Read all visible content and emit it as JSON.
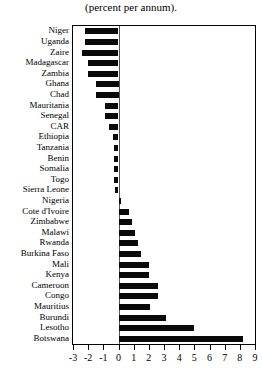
{
  "chart_data": {
    "type": "bar",
    "orientation": "horizontal",
    "title": "(percent per annum).",
    "xlabel": "",
    "ylabel": "",
    "xlim": [
      -3,
      9
    ],
    "xticks": [
      -3,
      -2,
      -1,
      0,
      1,
      2,
      3,
      4,
      5,
      6,
      7,
      8,
      9
    ],
    "xticklabels": [
      "-3",
      "-2",
      "-1",
      "0",
      "1",
      "2",
      "3",
      "4",
      "5",
      "6",
      "7",
      "8",
      "9"
    ],
    "grid": false,
    "legend": null,
    "bar_color": "#0a0a0a",
    "categories": [
      "Niger",
      "Uganda",
      "Zaire",
      "Madagascar",
      "Zambia",
      "Ghana",
      "Chad",
      "Mauritania",
      "Senegal",
      "CAR",
      "Ethiopia",
      "Tanzania",
      "Benin",
      "Somalia",
      "Togo",
      "Sierra Leone",
      "Nigeria",
      "Cote d'Ivoire",
      "Zimbabwe",
      "Malawi",
      "Rwanda",
      "Burkina Faso",
      "Mali",
      "Kenya",
      "Cameroon",
      "Congo",
      "Mauritius",
      "Burundi",
      "Lesotho",
      "Botswana"
    ],
    "values": [
      -2.2,
      -2.2,
      -2.4,
      -2.0,
      -2.0,
      -1.5,
      -1.5,
      -0.9,
      -0.9,
      -0.6,
      -0.35,
      -0.3,
      -0.3,
      -0.3,
      -0.3,
      -0.25,
      0.15,
      0.7,
      0.9,
      1.1,
      1.3,
      1.5,
      2.0,
      2.0,
      2.6,
      2.6,
      2.1,
      3.1,
      5.0,
      8.2
    ]
  }
}
